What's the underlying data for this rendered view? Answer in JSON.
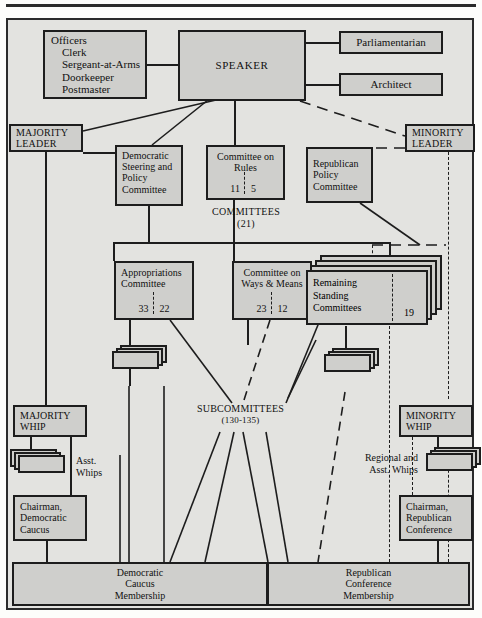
{
  "colors": {
    "box_fill": "#cfcfcc",
    "frame_fill": "#e3e3e0",
    "stroke": "#1d1d1d",
    "page": "#fdfdfb"
  },
  "nodes": {
    "officers": {
      "heading": "Officers",
      "items": [
        "Clerk",
        "Sergeant-at-Arms",
        "Doorkeeper",
        "Postmaster"
      ]
    },
    "speaker": {
      "label": "SPEAKER"
    },
    "parliamentarian": {
      "label": "Parliamentarian"
    },
    "architect": {
      "label": "Architect"
    },
    "majority_leader": {
      "line1": "MAJORITY",
      "line2": "LEADER"
    },
    "minority_leader": {
      "line1": "MINORITY",
      "line2": "LEADER"
    },
    "dem_steering": {
      "line1": "Democratic",
      "line2": "Steering and",
      "line3": "Policy",
      "line4": "Committee"
    },
    "rules": {
      "line1": "Committee on",
      "line2": "Rules",
      "majority_seats": "11",
      "minority_seats": "5"
    },
    "rep_policy": {
      "line1": "Republican",
      "line2": "Policy",
      "line3": "Committee"
    },
    "appropriations": {
      "line1": "Appropriations",
      "line2": "Committee",
      "majority_seats": "33",
      "minority_seats": "22"
    },
    "ways_means": {
      "line1": "Committee on",
      "line2": "Ways & Means",
      "majority_seats": "23",
      "minority_seats": "12"
    },
    "remaining": {
      "line1": "Remaining",
      "line2": "Standing",
      "line3": "Committees",
      "count": "19"
    },
    "majority_whip": {
      "line1": "MAJORITY",
      "line2": "WHIP"
    },
    "minority_whip": {
      "line1": "MINORITY",
      "line2": "WHIP"
    },
    "chairman_dem": {
      "line1": "Chairman,",
      "line2": "Democratic",
      "line3": "Caucus"
    },
    "chairman_rep": {
      "line1": "Chairman,",
      "line2": "Republican",
      "line3": "Conference"
    },
    "dem_membership": {
      "line1": "Democratic",
      "line2": "Caucus",
      "line3": "Membership"
    },
    "rep_membership": {
      "line1": "Republican",
      "line2": "Conference",
      "line3": "Membership"
    }
  },
  "labels": {
    "committees": {
      "line1": "COMMITTEES",
      "line2": "(21)"
    },
    "subcommittees": {
      "line1": "SUBCOMMITTEES",
      "line2": "(130-135)"
    },
    "asst_whips": {
      "line1": "Asst.",
      "line2": "Whips"
    },
    "regional_whips": {
      "line1": "Regional and",
      "line2": "Asst. Whips"
    }
  }
}
